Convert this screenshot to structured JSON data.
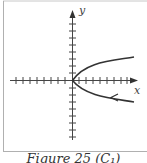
{
  "figure": {
    "caption": "Figure 25 (C₁)",
    "x_label": "x",
    "y_label": "y",
    "curve": "parabola opening right, vertex at origin",
    "direction_arrow": "on lower branch, pointing toward vertex",
    "colors": {
      "frame": "#b0b0b0",
      "axes": "#444444",
      "curve": "#333333"
    }
  }
}
